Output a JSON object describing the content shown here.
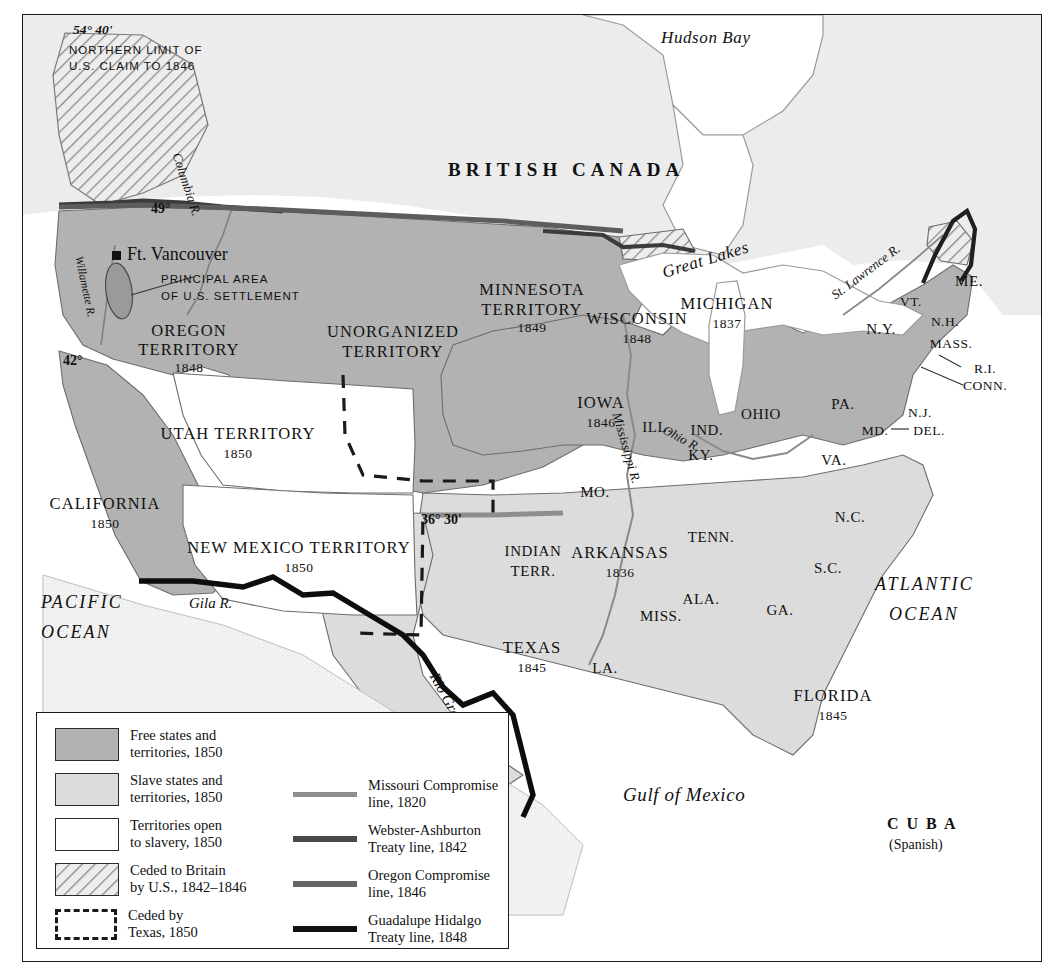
{
  "map": {
    "title": "United States 1850: Slavery and Territorial Expansion",
    "regions": {
      "british_canada": "BRITISH CANADA",
      "hudson_bay": "Hudson Bay",
      "great_lakes": "Great Lakes",
      "mexico": "M E X I C O",
      "gulf_of_mexico": "Gulf of Mexico",
      "pacific_ocean_l1": "PACIFIC",
      "pacific_ocean_l2": "OCEAN",
      "atlantic_ocean_l1": "ATLANTIC",
      "atlantic_ocean_l2": "OCEAN",
      "cuba": "C U B A",
      "cuba_sub": "(Spanish)"
    },
    "annotations": {
      "claim_lat": "54° 40'",
      "claim_l1": "NORTHERN LIMIT OF",
      "claim_l2": "U.S. CLAIM TO 1846",
      "lat_49": "49°",
      "lat_42": "42°",
      "lat_36_30": "36° 30'",
      "ft_vancouver": "Ft. Vancouver",
      "settlement_l1": "PRINCIPAL AREA",
      "settlement_l2": "OF U.S. SETTLEMENT"
    },
    "rivers": [
      {
        "name": "Columbia R."
      },
      {
        "name": "Willamette R."
      },
      {
        "name": "Mississippi R."
      },
      {
        "name": "Ohio R."
      },
      {
        "name": "St. Lawrence R."
      },
      {
        "name": "Gila R."
      },
      {
        "name": "Rio Grande"
      }
    ],
    "territories": [
      {
        "name": "OREGON",
        "name2": "TERRITORY",
        "year": "1848"
      },
      {
        "name": "UNORGANIZED",
        "name2": "TERRITORY",
        "year": ""
      },
      {
        "name": "UTAH TERRITORY",
        "name2": "",
        "year": "1850"
      },
      {
        "name": "NEW MEXICO TERRITORY",
        "name2": "",
        "year": "1850"
      },
      {
        "name": "MINNESOTA",
        "name2": "TERRITORY",
        "year": "1849"
      },
      {
        "name": "INDIAN",
        "name2": "TERR.",
        "year": ""
      }
    ],
    "states": [
      {
        "label": "CALIFORNIA",
        "year": "1850"
      },
      {
        "label": "TEXAS",
        "year": "1845"
      },
      {
        "label": "ARKANSAS",
        "year": "1836"
      },
      {
        "label": "WISCONSIN",
        "year": "1848"
      },
      {
        "label": "IOWA",
        "year": "1846"
      },
      {
        "label": "MICHIGAN",
        "year": "1837"
      },
      {
        "label": "FLORIDA",
        "year": "1845"
      },
      {
        "label": "ILL.",
        "year": ""
      },
      {
        "label": "IND.",
        "year": ""
      },
      {
        "label": "OHIO",
        "year": ""
      },
      {
        "label": "MO.",
        "year": ""
      },
      {
        "label": "KY.",
        "year": ""
      },
      {
        "label": "TENN.",
        "year": ""
      },
      {
        "label": "VA.",
        "year": ""
      },
      {
        "label": "N.C.",
        "year": ""
      },
      {
        "label": "S.C.",
        "year": ""
      },
      {
        "label": "GA.",
        "year": ""
      },
      {
        "label": "ALA.",
        "year": ""
      },
      {
        "label": "MISS.",
        "year": ""
      },
      {
        "label": "LA.",
        "year": ""
      },
      {
        "label": "PA.",
        "year": ""
      },
      {
        "label": "N.Y.",
        "year": ""
      },
      {
        "label": "VT.",
        "year": ""
      },
      {
        "label": "N.H.",
        "year": ""
      },
      {
        "label": "ME.",
        "year": ""
      },
      {
        "label": "MASS.",
        "year": ""
      },
      {
        "label": "R.I.",
        "year": ""
      },
      {
        "label": "CONN.",
        "year": ""
      },
      {
        "label": "N.J.",
        "year": ""
      },
      {
        "label": "MD.",
        "year": ""
      },
      {
        "label": "DEL.",
        "year": ""
      }
    ]
  },
  "legend": {
    "swatches": [
      {
        "line1": "Free states and",
        "line2": "territories, 1850",
        "fill": "#b2b2b2",
        "pattern": "solid"
      },
      {
        "line1": "Slave states and",
        "line2": "territories, 1850",
        "fill": "#dcdcdc",
        "pattern": "solid"
      },
      {
        "line1": "Territories open",
        "line2": "to slavery, 1850",
        "fill": "#ffffff",
        "pattern": "solid"
      },
      {
        "line1": "Ceded to Britain",
        "line2": "by U.S., 1842–1846",
        "fill": "#e8e8e8",
        "pattern": "hatch"
      },
      {
        "line1": "Ceded by",
        "line2": "Texas, 1850",
        "fill": "#ffffff",
        "pattern": "dashed"
      }
    ],
    "lines": [
      {
        "line1": "Missouri Compromise",
        "line2": "line, 1820",
        "color": "#8e8e8e"
      },
      {
        "line1": "Webster-Ashburton",
        "line2": "Treaty line, 1842",
        "color": "#4a4a4a"
      },
      {
        "line1": "Oregon Compromise",
        "line2": "line, 1846",
        "color": "#666666"
      },
      {
        "line1": "Guadalupe Hidalgo",
        "line2": "Treaty line, 1848",
        "color": "#111111"
      }
    ]
  },
  "colors": {
    "free": "#b2b2b2",
    "slave": "#dcdcdc",
    "open": "#ffffff",
    "canada": "#ececec",
    "water": "#ffffff",
    "border": "#6d6d6d",
    "frame": "#1a1a1a"
  }
}
